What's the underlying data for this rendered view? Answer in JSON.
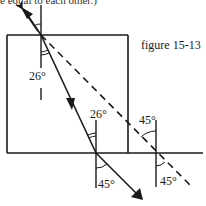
{
  "caption_fragment": "e equal to each other.)",
  "figure_label": "figure 15-13",
  "angles": {
    "incident_top": "",
    "refracted_entry": "26°",
    "refracted_exit": "26°",
    "exit_ray": "45°",
    "reflected_top": "45°",
    "reflected_bottom": "45°"
  },
  "colors": {
    "ink": "#1a1a1a",
    "background": "#ffffff"
  }
}
